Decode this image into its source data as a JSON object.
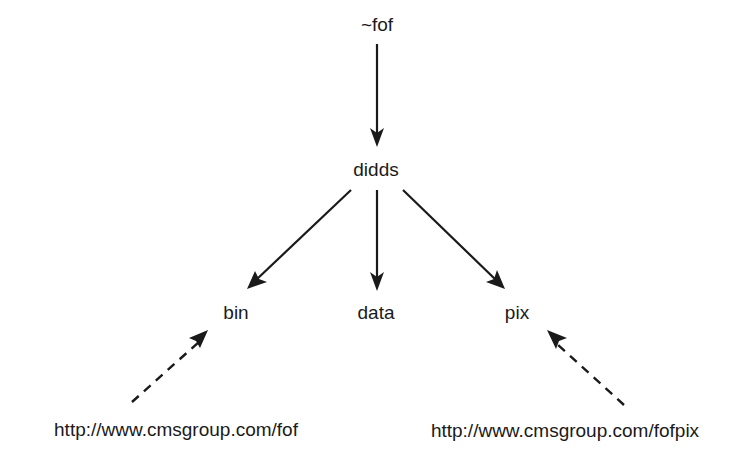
{
  "diagram": {
    "type": "directory-tree",
    "colors": {
      "line": "#1a1a1a",
      "text": "#1a1a1a",
      "background": "#ffffff"
    },
    "nodes": {
      "root": "~fof",
      "didds": "didds",
      "bin": "bin",
      "data": "data",
      "pix": "pix",
      "url_fof": "http://www.cmsgroup.com/fof",
      "url_fofpix": "http://www.cmsgroup.com/fofpix"
    },
    "edges": [
      {
        "from": "~fof",
        "to": "didds",
        "style": "solid"
      },
      {
        "from": "didds",
        "to": "bin",
        "style": "solid"
      },
      {
        "from": "didds",
        "to": "data",
        "style": "solid"
      },
      {
        "from": "didds",
        "to": "pix",
        "style": "solid"
      },
      {
        "from": "http://www.cmsgroup.com/fof",
        "to": "bin",
        "style": "dashed"
      },
      {
        "from": "http://www.cmsgroup.com/fofpix",
        "to": "pix",
        "style": "dashed"
      }
    ]
  }
}
